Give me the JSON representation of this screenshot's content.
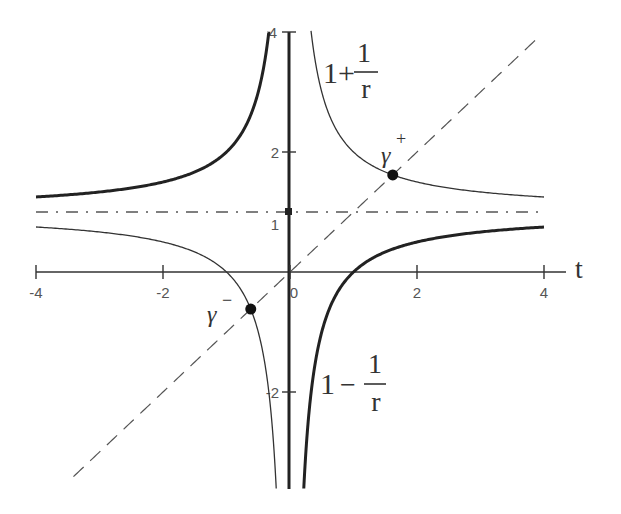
{
  "chart_data": {
    "type": "line",
    "title": "",
    "xlabel": "t",
    "ylabel": "",
    "xlim": [
      -4,
      4
    ],
    "ylim": [
      -3.6,
      4
    ],
    "grid": false,
    "x_ticks": [
      {
        "value": -4,
        "label": "-4"
      },
      {
        "value": -2,
        "label": "-2"
      },
      {
        "value": 0,
        "label": "0"
      },
      {
        "value": 2,
        "label": "2"
      },
      {
        "value": 4,
        "label": "4"
      }
    ],
    "y_ticks": [
      {
        "value": 4,
        "label": "4"
      },
      {
        "value": 2,
        "label": "2"
      },
      {
        "value": 1,
        "label": "1"
      },
      {
        "value": -2,
        "label": "-2"
      }
    ],
    "series": [
      {
        "name": "1+1/r",
        "formula": "1 + 1/t",
        "style": "thin solid",
        "color": "#333333",
        "branches": [
          [
            -4,
            -0.217
          ],
          [
            0.31,
            4
          ]
        ]
      },
      {
        "name": "1-1/r",
        "formula": "1 - 1/t",
        "style": "thick solid",
        "color": "#222222",
        "branches": [
          [
            -4,
            -0.333
          ],
          [
            0.217,
            4
          ]
        ]
      },
      {
        "name": "y = t",
        "formula": "t",
        "style": "dashed",
        "color": "#555555",
        "branches": [
          [
            -3.41,
            3.9
          ]
        ]
      },
      {
        "name": "y = 1",
        "formula": "1",
        "style": "dash-dot",
        "color": "#555555",
        "branches": [
          [
            -4,
            4
          ]
        ]
      }
    ],
    "points": [
      {
        "name": "gamma-plus",
        "label": "γ",
        "sup": "+",
        "t": 1.618,
        "y": 1.618
      },
      {
        "name": "gamma-minus",
        "label": "γ",
        "sup": "−",
        "t": -0.618,
        "y": -0.618
      }
    ],
    "annotations": [
      {
        "name": "label-1-plus-1-over-r",
        "lead": "1+",
        "num": "1",
        "den": "r"
      },
      {
        "name": "label-1-minus-1-over-r",
        "lead": "1 −",
        "num": "1",
        "den": "r"
      }
    ]
  },
  "axis": {
    "x_label": "t"
  },
  "labels": {
    "plus": {
      "lead": "1+",
      "num": "1",
      "den": "r"
    },
    "minus": {
      "lead": "1",
      "op": "−",
      "num": "1",
      "den": "r"
    },
    "gamma_plus": {
      "base": "γ",
      "sup": "+"
    },
    "gamma_minus": {
      "base": "γ",
      "sup": "−"
    }
  }
}
